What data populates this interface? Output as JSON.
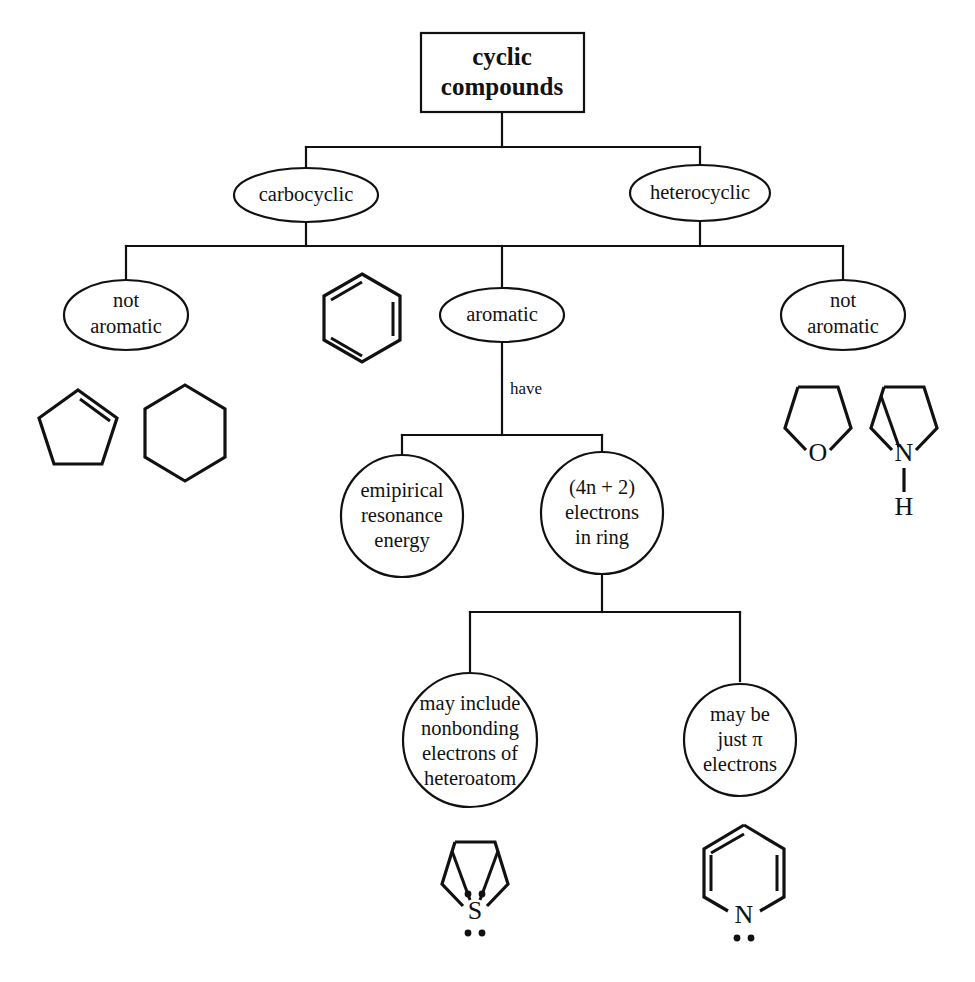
{
  "diagram": {
    "title_box": {
      "lines": [
        "cyclic",
        "compounds"
      ]
    },
    "level1": [
      {
        "id": "carbocyclic",
        "label": "carbocyclic"
      },
      {
        "id": "heterocyclic",
        "label": "heterocyclic"
      }
    ],
    "level2": [
      {
        "id": "not-aromatic-left",
        "lines": [
          "not",
          "aromatic"
        ]
      },
      {
        "id": "aromatic",
        "lines": [
          "aromatic"
        ]
      },
      {
        "id": "not-aromatic-right",
        "lines": [
          "not",
          "aromatic"
        ]
      }
    ],
    "edge_labels": {
      "aromatic_have": "have"
    },
    "level3": [
      {
        "id": "empirical-resonance-energy",
        "lines": [
          "emipirical",
          "resonance",
          "energy"
        ]
      },
      {
        "id": "four-n-plus-two-electrons",
        "lines": [
          "(4n + 2)",
          "electrons",
          "in ring"
        ]
      }
    ],
    "level4": [
      {
        "id": "nonbonding-electrons-heteroatom",
        "lines": [
          "may include",
          "nonbonding",
          "electrons of",
          "heteroatom"
        ]
      },
      {
        "id": "just-pi-electrons",
        "lines": [
          "may be",
          "just π",
          "electrons"
        ]
      }
    ],
    "molecules": [
      {
        "id": "benzene",
        "name": "benzene",
        "atom_labels": []
      },
      {
        "id": "cyclopentene",
        "name": "cyclopentene",
        "atom_labels": []
      },
      {
        "id": "cyclohexane",
        "name": "cyclohexane",
        "atom_labels": []
      },
      {
        "id": "tetrahydrofuran",
        "name": "tetrahydrofuran",
        "atom_labels": [
          "O"
        ]
      },
      {
        "id": "pyrroline",
        "name": "3-pyrroline",
        "atom_labels": [
          "N",
          "H"
        ]
      },
      {
        "id": "thiophene",
        "name": "thiophene",
        "atom_labels": [
          "S"
        ]
      },
      {
        "id": "pyridine",
        "name": "pyridine",
        "atom_labels": [
          "N"
        ]
      }
    ],
    "atoms": {
      "oxygen": "O",
      "nitrogen": "N",
      "hydrogen": "H",
      "sulfur": "S",
      "nitrogen_pyridine": "N"
    },
    "colors": {
      "ink": "#111111",
      "page": "#ffffff"
    }
  }
}
